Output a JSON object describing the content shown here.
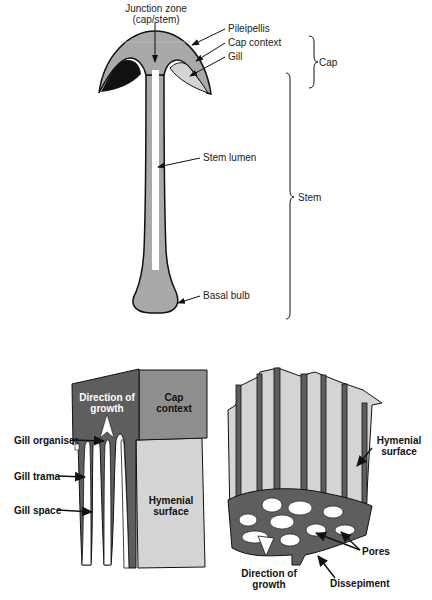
{
  "figure": {
    "top_panel": {
      "name": "Mushroom fruit body longitudinal section",
      "labels": {
        "junction_zone_line1": "Junction zone",
        "junction_zone_line2": "(cap/stem)",
        "pileipellis": "Pileipellis",
        "cap_context": "Cap context",
        "gill": "Gill",
        "stem_lumen": "Stem lumen",
        "basal_bulb": "Basal bulb"
      },
      "brackets": {
        "cap": "Cap",
        "stem": "Stem"
      }
    },
    "bottom_left_panel": {
      "name": "Gill block",
      "labels": {
        "direction_line1": "Direction of",
        "direction_line2": "growth",
        "cap_context_line1": "Cap",
        "cap_context_line2": "context",
        "gill_organiser": "Gill organiser",
        "gill_trama": "Gill trama",
        "gill_space": "Gill space",
        "hymenial_line1": "Hymenial",
        "hymenial_line2": "surface"
      }
    },
    "bottom_right_panel": {
      "name": "Pore block",
      "labels": {
        "hymenial_line1": "Hymenial",
        "hymenial_line2": "surface",
        "pores": "Pores",
        "direction_line1": "Direction of",
        "direction_line2": "growth",
        "dissepiment": "Dissepiment"
      }
    },
    "colors": {
      "tissue_mid_gray": "#a9a9a9",
      "tissue_dark_gray": "#5e5e5e",
      "tissue_light_gray": "#d4d4d4",
      "cap_context_gray": "#8e8e8e",
      "black": "#111111",
      "white": "#ffffff"
    }
  }
}
